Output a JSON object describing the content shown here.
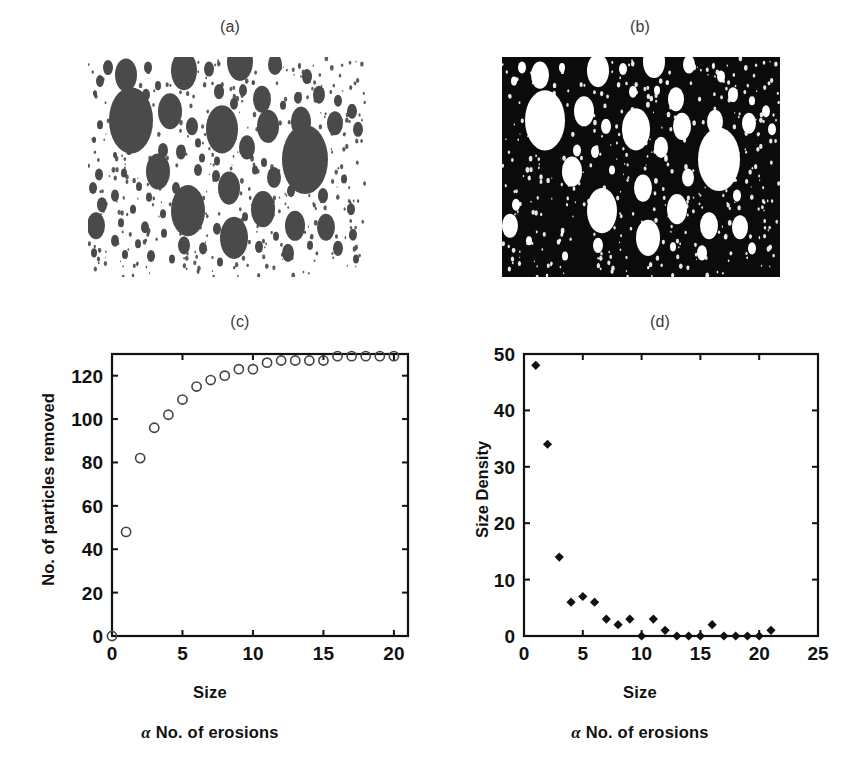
{
  "figure": {
    "background": "#ffffff",
    "panels": [
      {
        "id": "a",
        "label": "(a)",
        "kind": "image",
        "description": "binary particle image, dark discs on white background"
      },
      {
        "id": "b",
        "label": "(b)",
        "kind": "image",
        "description": "inverted binary particle image, white discs on black background"
      },
      {
        "id": "c",
        "label": "(c)",
        "kind": "chart"
      },
      {
        "id": "d",
        "label": "(d)",
        "kind": "chart"
      }
    ]
  },
  "captions": {
    "alpha": "α",
    "erosions_text": "No. of erosions",
    "size": "Size"
  },
  "colors": {
    "particle_dark": "#4a4a4a",
    "particle_light": "#ffffff",
    "background_black": "#0b0b0b",
    "background_white": "#ffffff",
    "axis": "#111111",
    "marker_open": "#444444",
    "marker_filled": "#111111"
  },
  "chart_data": [
    {
      "type": "scatter",
      "panel": "c",
      "title": "(c)",
      "xlabel": "Size",
      "ylabel": "No. of particles removed",
      "sub_xlabel": "α No. of erosions",
      "xlim": [
        0,
        21
      ],
      "ylim": [
        0,
        130
      ],
      "xticks": [
        0,
        5,
        10,
        15,
        20
      ],
      "yticks": [
        0,
        20,
        40,
        60,
        80,
        100,
        120
      ],
      "grid": false,
      "legend": null,
      "marker": "open-circle",
      "x": [
        0,
        1,
        2,
        3,
        4,
        5,
        6,
        7,
        8,
        9,
        10,
        11,
        12,
        13,
        14,
        15,
        16,
        17,
        18,
        19,
        20
      ],
      "values": [
        0,
        48,
        82,
        96,
        102,
        109,
        115,
        118,
        120,
        123,
        123,
        126,
        127,
        127,
        127,
        127,
        129,
        129,
        129,
        129,
        129
      ]
    },
    {
      "type": "scatter",
      "panel": "d",
      "title": "(d)",
      "xlabel": "Size",
      "ylabel": "Size Density",
      "sub_xlabel": "α No. of erosions",
      "xlim": [
        0,
        25
      ],
      "ylim": [
        0,
        50
      ],
      "xticks": [
        0,
        5,
        10,
        15,
        20,
        25
      ],
      "yticks": [
        0,
        10,
        20,
        30,
        40,
        50
      ],
      "grid": false,
      "legend": null,
      "marker": "filled-diamond",
      "x": [
        1,
        2,
        3,
        4,
        5,
        6,
        7,
        8,
        9,
        10,
        11,
        12,
        13,
        14,
        15,
        16,
        17,
        18,
        19,
        20,
        21
      ],
      "values": [
        48,
        34,
        14,
        6,
        7,
        6,
        3,
        2,
        3,
        0,
        3,
        1,
        0,
        0,
        0,
        2,
        0,
        0,
        0,
        0,
        1
      ]
    }
  ],
  "image_a": {
    "label": "(a)",
    "circles": [
      [
        38,
        12,
        11
      ],
      [
        20,
        7,
        5
      ],
      [
        60,
        7,
        4
      ],
      [
        96,
        9,
        13
      ],
      [
        121,
        8,
        5
      ],
      [
        152,
        3,
        13
      ],
      [
        187,
        5,
        7
      ],
      [
        12,
        16,
        4
      ],
      [
        70,
        19,
        3
      ],
      [
        155,
        22,
        4
      ],
      [
        219,
        13,
        5
      ],
      [
        47,
        27,
        5
      ],
      [
        58,
        25,
        4
      ],
      [
        131,
        23,
        5
      ],
      [
        174,
        28,
        9
      ],
      [
        210,
        27,
        4
      ],
      [
        231,
        25,
        6
      ],
      [
        7,
        24,
        2
      ],
      [
        250,
        29,
        4
      ],
      [
        43,
        42,
        22
      ],
      [
        82,
        36,
        12
      ],
      [
        146,
        31,
        4
      ],
      [
        195,
        32,
        3
      ],
      [
        264,
        36,
        5
      ],
      [
        12,
        45,
        3
      ],
      [
        104,
        46,
        6
      ],
      [
        134,
        48,
        16
      ],
      [
        180,
        46,
        11
      ],
      [
        213,
        43,
        10
      ],
      [
        247,
        44,
        8
      ],
      [
        270,
        48,
        5
      ],
      [
        6,
        55,
        2
      ],
      [
        110,
        57,
        3
      ],
      [
        75,
        62,
        5
      ],
      [
        93,
        63,
        5
      ],
      [
        159,
        60,
        8
      ],
      [
        114,
        67,
        3
      ],
      [
        129,
        69,
        3
      ],
      [
        217,
        68,
        23
      ],
      [
        41,
        62,
        3
      ],
      [
        27,
        65,
        2
      ],
      [
        63,
        69,
        2
      ],
      [
        176,
        70,
        3
      ],
      [
        11,
        78,
        4
      ],
      [
        36,
        77,
        3
      ],
      [
        70,
        76,
        12
      ],
      [
        110,
        75,
        4
      ],
      [
        128,
        79,
        4
      ],
      [
        167,
        75,
        3
      ],
      [
        186,
        80,
        7
      ],
      [
        256,
        81,
        3
      ],
      [
        5,
        87,
        4
      ],
      [
        51,
        86,
        3
      ],
      [
        88,
        87,
        4
      ],
      [
        141,
        87,
        11
      ],
      [
        203,
        89,
        4
      ],
      [
        235,
        92,
        5
      ],
      [
        27,
        92,
        4
      ],
      [
        61,
        93,
        3
      ],
      [
        14,
        98,
        5
      ],
      [
        100,
        102,
        17
      ],
      [
        45,
        101,
        3
      ],
      [
        75,
        104,
        3
      ],
      [
        175,
        101,
        12
      ],
      [
        263,
        101,
        4
      ],
      [
        157,
        106,
        3
      ],
      [
        8,
        112,
        9
      ],
      [
        33,
        110,
        3
      ],
      [
        57,
        113,
        4
      ],
      [
        129,
        114,
        4
      ],
      [
        207,
        112,
        10
      ],
      [
        238,
        113,
        9
      ],
      [
        76,
        117,
        3
      ],
      [
        146,
        120,
        14
      ],
      [
        188,
        119,
        3
      ],
      [
        265,
        118,
        4
      ],
      [
        27,
        122,
        4
      ],
      [
        50,
        124,
        3
      ],
      [
        96,
        125,
        6
      ],
      [
        115,
        127,
        4
      ],
      [
        171,
        126,
        4
      ],
      [
        222,
        125,
        3
      ],
      [
        250,
        127,
        5
      ],
      [
        6,
        130,
        3
      ],
      [
        37,
        131,
        3
      ],
      [
        63,
        132,
        4
      ],
      [
        200,
        130,
        6
      ],
      [
        84,
        134,
        3
      ],
      [
        132,
        136,
        3
      ],
      [
        268,
        134,
        3
      ]
    ]
  },
  "image_b": {
    "label": "(b)",
    "circles": [
      [
        38,
        12,
        9
      ],
      [
        20,
        7,
        4
      ],
      [
        60,
        7,
        3
      ],
      [
        96,
        9,
        11
      ],
      [
        121,
        8,
        4
      ],
      [
        152,
        3,
        11
      ],
      [
        187,
        5,
        6
      ],
      [
        12,
        16,
        3
      ],
      [
        155,
        22,
        3
      ],
      [
        219,
        13,
        4
      ],
      [
        47,
        27,
        4
      ],
      [
        131,
        23,
        4
      ],
      [
        174,
        28,
        8
      ],
      [
        231,
        25,
        5
      ],
      [
        250,
        29,
        3
      ],
      [
        43,
        42,
        20
      ],
      [
        82,
        36,
        10
      ],
      [
        264,
        36,
        4
      ],
      [
        104,
        46,
        5
      ],
      [
        134,
        48,
        14
      ],
      [
        180,
        46,
        9
      ],
      [
        213,
        43,
        8
      ],
      [
        247,
        44,
        7
      ],
      [
        270,
        48,
        4
      ],
      [
        75,
        62,
        4
      ],
      [
        93,
        63,
        4
      ],
      [
        159,
        60,
        7
      ],
      [
        217,
        68,
        21
      ],
      [
        70,
        76,
        10
      ],
      [
        110,
        75,
        3
      ],
      [
        186,
        80,
        6
      ],
      [
        141,
        87,
        9
      ],
      [
        235,
        92,
        4
      ],
      [
        14,
        98,
        4
      ],
      [
        100,
        102,
        15
      ],
      [
        175,
        101,
        10
      ],
      [
        8,
        112,
        8
      ],
      [
        207,
        112,
        9
      ],
      [
        238,
        113,
        8
      ],
      [
        146,
        120,
        12
      ],
      [
        96,
        125,
        5
      ],
      [
        250,
        127,
        4
      ],
      [
        200,
        130,
        5
      ],
      [
        27,
        122,
        3
      ],
      [
        171,
        126,
        3
      ],
      [
        63,
        132,
        3
      ]
    ]
  }
}
